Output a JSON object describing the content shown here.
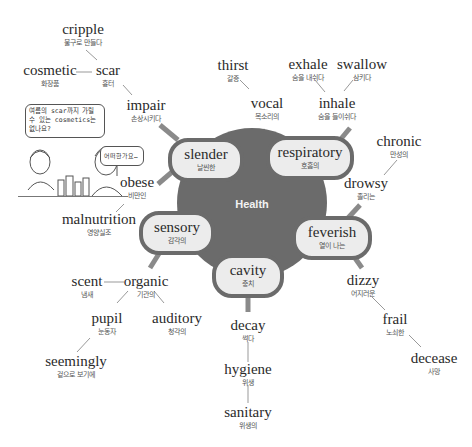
{
  "center": {
    "label": "Health",
    "color": "#6b6b6b"
  },
  "nodes": [
    {
      "id": "slender",
      "en": "slender",
      "ko": "날씬한"
    },
    {
      "id": "respiratory",
      "en": "respiratory",
      "ko": "호흡의"
    },
    {
      "id": "sensory",
      "en": "sensory",
      "ko": "감각의"
    },
    {
      "id": "feverish",
      "en": "feverish",
      "ko": "열이 나는"
    },
    {
      "id": "cavity",
      "en": "cavity",
      "ko": "충치"
    }
  ],
  "words": {
    "cripple": {
      "en": "cripple",
      "ko": "불구로 만들다"
    },
    "cosmetic": {
      "en": "cosmetic",
      "ko": "화장품"
    },
    "scar": {
      "en": "scar",
      "ko": "흉터"
    },
    "impair": {
      "en": "impair",
      "ko": "손상시키다"
    },
    "obese": {
      "en": "obese",
      "ko": "비만인"
    },
    "malnutrition": {
      "en": "malnutrition",
      "ko": "영양실조"
    },
    "thirst": {
      "en": "thirst",
      "ko": "갈증"
    },
    "vocal": {
      "en": "vocal",
      "ko": "목소리의"
    },
    "exhale": {
      "en": "exhale",
      "ko": "숨을 내쉬다"
    },
    "swallow": {
      "en": "swallow",
      "ko": "삼키다"
    },
    "inhale": {
      "en": "inhale",
      "ko": "숨을 들이쉬다"
    },
    "chronic": {
      "en": "chronic",
      "ko": "만성의"
    },
    "drowsy": {
      "en": "drowsy",
      "ko": "졸리는"
    },
    "scent": {
      "en": "scent",
      "ko": "냄새"
    },
    "organic": {
      "en": "organic",
      "ko": "기관의"
    },
    "pupil": {
      "en": "pupil",
      "ko": "눈동자"
    },
    "auditory": {
      "en": "auditory",
      "ko": "청각의"
    },
    "seemingly": {
      "en": "seemingly",
      "ko": "겉으로 보기에"
    },
    "decay": {
      "en": "decay",
      "ko": "썩다"
    },
    "hygiene": {
      "en": "hygiene",
      "ko": "위생"
    },
    "sanitary": {
      "en": "sanitary",
      "ko": "위생의"
    },
    "dizzy": {
      "en": "dizzy",
      "ko": "어지러운"
    },
    "frail": {
      "en": "frail",
      "ko": "노쇠한"
    },
    "decease": {
      "en": "decease",
      "ko": "사망"
    }
  },
  "comic": {
    "bubble1": "여름의 scar까지 가릴 수 있는 cosmetics는 없나요?",
    "bubble2": "어떠한가요…"
  }
}
